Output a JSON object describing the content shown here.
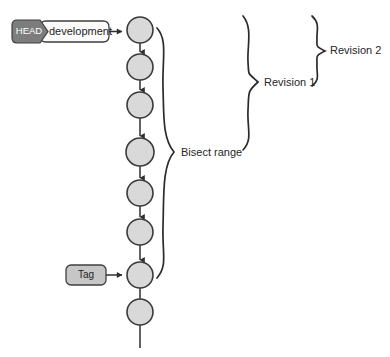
{
  "diagram": {
    "background_color": "#ffffff"
  },
  "colors": {
    "node_fill": "#d9d9d9",
    "node_stroke": "#3a3a3a",
    "head_badge_fill": "#7d7d7d",
    "head_badge_text": "#ffffff",
    "branch_badge_fill": "#fbfbfb",
    "tag_badge_fill": "#c6c6c6",
    "line_stroke": "#2e2e2e",
    "text_color": "#262626"
  },
  "badges": {
    "head": {
      "label": "HEAD"
    },
    "branch": {
      "label": "development"
    },
    "tag": {
      "label": "Tag"
    }
  },
  "annotations": {
    "bisect_range": {
      "label": "Bisect range"
    },
    "revision_1": {
      "label": "Revision 1"
    },
    "revision_2": {
      "label": "Revision 2"
    }
  },
  "commits": [
    {
      "id": "commit-1",
      "cx": 140,
      "cy": 30,
      "r": 13
    },
    {
      "id": "commit-2",
      "cx": 140,
      "cy": 67,
      "r": 13
    },
    {
      "id": "commit-3",
      "cx": 140,
      "cy": 105,
      "r": 13
    },
    {
      "id": "commit-4",
      "cx": 140,
      "cy": 152,
      "r": 14
    },
    {
      "id": "commit-5",
      "cx": 140,
      "cy": 193,
      "r": 13
    },
    {
      "id": "commit-6",
      "cx": 140,
      "cy": 232,
      "r": 13
    },
    {
      "id": "commit-7",
      "cx": 140,
      "cy": 275,
      "r": 13
    },
    {
      "id": "commit-8",
      "cx": 140,
      "cy": 312,
      "r": 13
    }
  ]
}
